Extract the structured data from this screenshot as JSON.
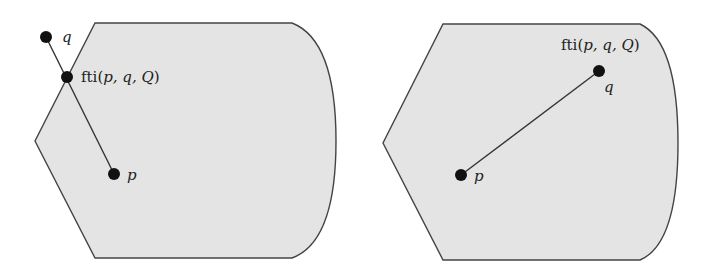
{
  "figure": {
    "panels": [
      {
        "id": "left",
        "description": "Point q lies outside region Q; segment from p to q exits the region at fti(p,q,Q)",
        "labels": {
          "q": "q",
          "p": "p",
          "fti_prefix": "fti(",
          "fti_args": "p, q, Q",
          "fti_suffix": ")"
        }
      },
      {
        "id": "right",
        "description": "Point q lies inside region Q; fti(p,q,Q) coincides with q",
        "labels": {
          "q": "q",
          "p": "p",
          "fti_prefix": "fti(",
          "fti_args": "p, q, Q",
          "fti_suffix": ")"
        }
      }
    ],
    "colors": {
      "region_fill": "#e4e4e4",
      "outline": "#444444",
      "point": "#111111"
    }
  }
}
